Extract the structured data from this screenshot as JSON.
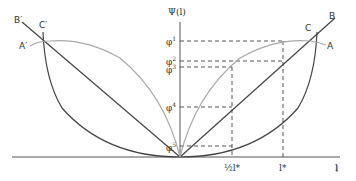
{
  "diagram": {
    "y_axis_label": "Ψ(l)",
    "x_axis_label": "l",
    "y_ticks": [
      {
        "label": "φ",
        "sup": "1"
      },
      {
        "label": "φ",
        "sup": "2"
      },
      {
        "label": "φ",
        "sup": "3"
      },
      {
        "label": "φ",
        "sup": "4"
      },
      {
        "label": "φ",
        "sup": "5"
      }
    ],
    "x_ticks": [
      {
        "label": "½l*"
      },
      {
        "label": "l*"
      }
    ],
    "curve_labels": {
      "A": "A",
      "B": "B",
      "C": "C",
      "A_prime": "A′",
      "B_prime": "B′",
      "C_prime": "C′"
    },
    "colors": {
      "dark_line": "#444444",
      "gray_curve": "#a8a8a8",
      "dashed": "#444444",
      "text": "#333333"
    }
  }
}
